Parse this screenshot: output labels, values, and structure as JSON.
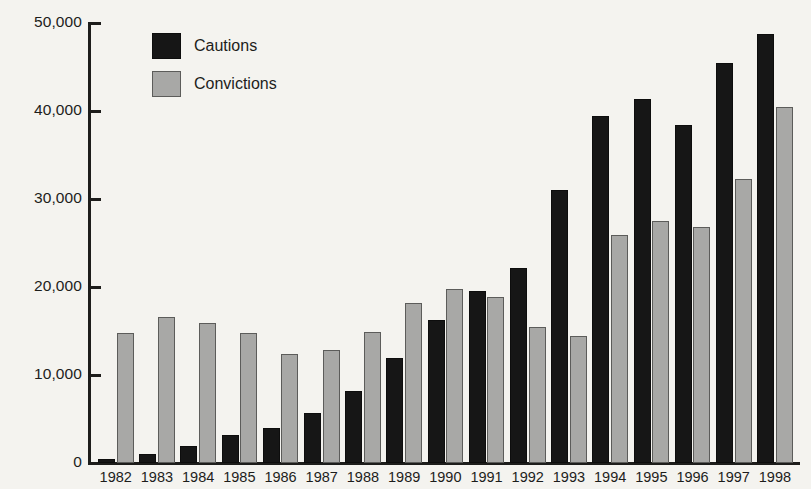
{
  "chart_data": {
    "type": "bar",
    "title": "",
    "xlabel": "",
    "ylabel": "",
    "ylim": [
      0,
      50000
    ],
    "yticks": [
      0,
      10000,
      20000,
      30000,
      40000,
      50000
    ],
    "ytick_labels": [
      "0",
      "10,000",
      "20,000",
      "30,000",
      "40,000",
      "50,000"
    ],
    "grid": false,
    "legend_position": "top-left",
    "categories": [
      "1982",
      "1983",
      "1984",
      "1985",
      "1986",
      "1987",
      "1988",
      "1989",
      "1990",
      "1991",
      "1992",
      "1993",
      "1994",
      "1995",
      "1996",
      "1997",
      "1998"
    ],
    "series": [
      {
        "name": "Cautions",
        "color": "#161616",
        "values": [
          400,
          1000,
          1900,
          3200,
          4000,
          5700,
          8200,
          11900,
          16200,
          19600,
          22200,
          31000,
          39400,
          41400,
          38400,
          45500,
          48700
        ]
      },
      {
        "name": "Convictions",
        "color": "#a8a8a6",
        "values": [
          14800,
          16600,
          15900,
          14800,
          12400,
          12800,
          14900,
          18200,
          19800,
          18900,
          15400,
          14400,
          25900,
          27500,
          26800,
          32300,
          40400
        ]
      }
    ]
  },
  "legend": {
    "items": [
      {
        "label": "Cautions",
        "color": "#161616"
      },
      {
        "label": "Convictions",
        "color": "#a8a8a6"
      }
    ]
  },
  "colors": {
    "background": "#f4f3ef",
    "axis": "#1d1d1b",
    "cautions": "#161616",
    "convictions": "#a8a8a6"
  }
}
